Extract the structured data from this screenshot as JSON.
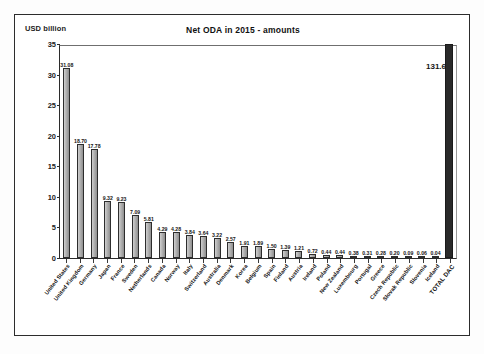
{
  "chart": {
    "title": "Net ODA in 2015 - amounts",
    "unit_label": "USD billion"
  },
  "chart_data": {
    "type": "bar",
    "title": "Net ODA in 2015 - amounts",
    "xlabel": "",
    "ylabel": "USD billion",
    "ylim": [
      0,
      35
    ],
    "yticks": [
      0,
      5,
      10,
      15,
      20,
      25,
      30,
      35
    ],
    "grid": false,
    "legend": null,
    "note": "TOTAL DAC bar value 131.6 exceeds axis maximum and is drawn clipped at the top of the plot",
    "categories": [
      "United States",
      "United Kingdom",
      "Germany",
      "Japan",
      "France",
      "Sweden",
      "Netherlands",
      "Canada",
      "Norway",
      "Italy",
      "Switzerland",
      "Australia",
      "Denmark",
      "Korea",
      "Belgium",
      "Spain",
      "Finland",
      "Austria",
      "Ireland",
      "Poland",
      "New Zealand",
      "Luxembourg",
      "Portugal",
      "Greece",
      "Czech Republic",
      "Slovak Republic",
      "Slovenia",
      "Iceland",
      "TOTAL DAC"
    ],
    "values": [
      31.08,
      18.7,
      17.78,
      9.32,
      9.23,
      7.09,
      5.81,
      4.29,
      4.28,
      3.84,
      3.64,
      3.22,
      2.57,
      1.91,
      1.89,
      1.5,
      1.39,
      1.21,
      0.72,
      0.44,
      0.44,
      0.38,
      0.31,
      0.28,
      0.2,
      0.09,
      0.06,
      0.04,
      131.6
    ],
    "value_labels": [
      "31.08",
      "18.70",
      "17.78",
      "9.32",
      "9.23",
      "7.09",
      "5.81",
      "4.29",
      "4.28",
      "3.84",
      "3.64",
      "3.22",
      "2.57",
      "1.91",
      "1.89",
      "1.50",
      "1.39",
      "1.21",
      "0.72",
      "0.44",
      "0.44",
      "0.38",
      "0.31",
      "0.28",
      "0.20",
      "0.09",
      "0.06",
      "0.04",
      "131.6"
    ],
    "colors": {
      "bar_fill": "#b4b4b4",
      "bar_outline": "#2d2d2d",
      "total_bar_fill": "#2a2a2a",
      "axis": "#2b2b2b",
      "text": "#141414"
    }
  }
}
